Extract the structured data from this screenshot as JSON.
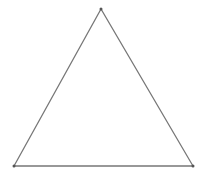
{
  "diagram": {
    "shape": "triangle",
    "stroke_color": "#777777",
    "vertex_color": "#555555",
    "background": "#ffffff",
    "vertices": [
      {
        "name": "top",
        "x": 101,
        "y": 9
      },
      {
        "name": "bottom-left",
        "x": 14,
        "y": 166
      },
      {
        "name": "bottom-right",
        "x": 193,
        "y": 166
      }
    ]
  }
}
